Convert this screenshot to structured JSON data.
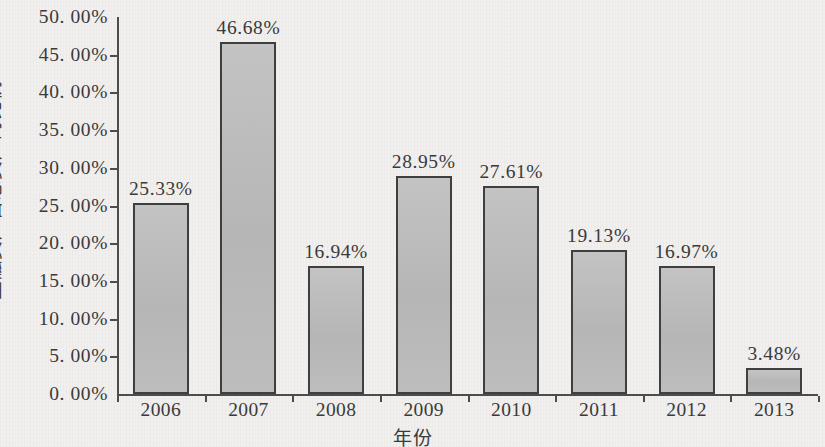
{
  "chart_data": {
    "type": "bar",
    "title": "",
    "categories": [
      "2006",
      "2007",
      "2008",
      "2009",
      "2010",
      "2011",
      "2012",
      "2013"
    ],
    "values": [
      25.33,
      46.68,
      16.94,
      28.95,
      27.61,
      19.13,
      16.97,
      3.48
    ],
    "data_labels": [
      "25.33%",
      "46.68%",
      "16.94%",
      "28.95%",
      "27.61%",
      "19.13%",
      "16.97%",
      "3.48%"
    ],
    "xlabel": "年份",
    "ylabel": "金融资产占总资产的比例",
    "ylim": [
      0,
      50
    ],
    "ytick_values": [
      0,
      5,
      10,
      15,
      20,
      25,
      30,
      35,
      40,
      45,
      50
    ],
    "ytick_labels": [
      "0. 00%",
      "5. 00%",
      "10. 00%",
      "15. 00%",
      "20. 00%",
      "25. 00%",
      "30. 00%",
      "35. 00%",
      "40. 00%",
      "45. 00%",
      "50. 00%"
    ],
    "grid": false,
    "legend": false,
    "series": [
      {
        "name": "金融资产占总资产的比例",
        "values": [
          25.33,
          46.68,
          16.94,
          28.95,
          27.61,
          19.13,
          16.97,
          3.48
        ]
      }
    ],
    "colors": {
      "bar_fill": "#bababa",
      "bar_border": "#3f3f3f",
      "axis": "#4c4c4c",
      "text": "#3a3a3a",
      "background": "#f1f0ee"
    }
  }
}
